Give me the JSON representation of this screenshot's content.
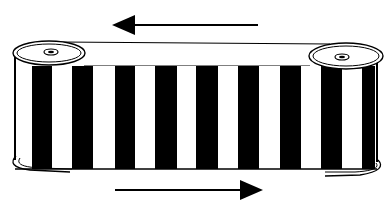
{
  "diagram": {
    "title": "",
    "colors": {
      "stroke": "#000000",
      "fill": "#ffffff",
      "stripe": "#000000"
    },
    "band": {
      "top_y": 66,
      "bottom_y": 169,
      "left_x": 15,
      "right_x": 377,
      "black_stripes": [
        [
          32,
          52
        ],
        [
          72,
          93
        ],
        [
          115,
          135
        ],
        [
          155,
          177
        ],
        [
          196,
          218
        ],
        [
          238,
          259
        ],
        [
          280,
          301
        ],
        [
          321,
          342
        ],
        [
          362,
          375
        ]
      ]
    },
    "spools": [
      {
        "name": "left-spool",
        "cx": 49,
        "cy": 53,
        "rx": 36,
        "ry": 12,
        "hub": {
          "cx": 51,
          "cy": 52,
          "rx": 7,
          "ry": 3
        }
      },
      {
        "name": "right-spool",
        "cx": 346,
        "cy": 56,
        "rx": 37,
        "ry": 13,
        "hub": {
          "cx": 342,
          "cy": 57,
          "rx": 7,
          "ry": 3
        }
      }
    ],
    "arrows": [
      {
        "name": "top-arrow",
        "direction": "left",
        "tail_x": 258,
        "head_tip_x": 112,
        "head_base_x": 135,
        "y": 25,
        "head_half": 10
      },
      {
        "name": "bottom-arrow",
        "direction": "right",
        "tail_x": 115,
        "head_tip_x": 263,
        "head_base_x": 240,
        "y": 190,
        "head_half": 10
      }
    ]
  }
}
